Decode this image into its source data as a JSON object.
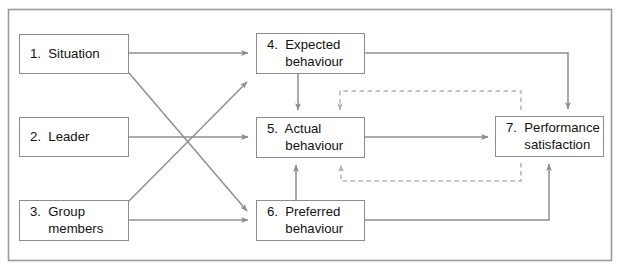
{
  "figure": {
    "frame": {
      "stroke": "#9a9a9a",
      "x": 8,
      "y": 9,
      "width": 604,
      "height": 252
    },
    "canvas": {
      "width": 621,
      "height": 275,
      "background": "#ffffff"
    },
    "colors": {
      "box_border": "#8c8c8c",
      "text": "#111111",
      "solid_arrow": "#8f8f8f",
      "dashed_arrow": "#b4b4b4",
      "background": "#ffffff"
    }
  },
  "nodes": [
    {
      "id": "n1",
      "number": "1.",
      "label": "Situation",
      "text": "1.  Situation",
      "x": 19,
      "y": 34,
      "width": 110,
      "height": 40
    },
    {
      "id": "n2",
      "number": "2.",
      "label": "Leader",
      "text": "2.  Leader",
      "x": 19,
      "y": 117,
      "width": 110,
      "height": 40
    },
    {
      "id": "n3",
      "number": "3.",
      "label": "Group members",
      "text": "3.  Group\n     members",
      "x": 19,
      "y": 200,
      "width": 110,
      "height": 41
    },
    {
      "id": "n4",
      "number": "4.",
      "label": "Expected behaviour",
      "text": "4.  Expected\n     behaviour",
      "x": 256,
      "y": 33,
      "width": 109,
      "height": 41
    },
    {
      "id": "n5",
      "number": "5.",
      "label": "Actual behaviour",
      "text": "5.  Actual\n     behaviour",
      "x": 256,
      "y": 117,
      "width": 109,
      "height": 41
    },
    {
      "id": "n6",
      "number": "6.",
      "label": "Preferred behaviour",
      "text": "6.  Preferred\n     behaviour",
      "x": 256,
      "y": 200,
      "width": 109,
      "height": 41
    },
    {
      "id": "n7",
      "number": "7.",
      "label": "Performance satisfaction",
      "text": "7.  Performance\n     satisfaction",
      "x": 495,
      "y": 116,
      "width": 109,
      "height": 41
    }
  ],
  "edges": [
    {
      "id": "e1",
      "from": "n1",
      "to": "n4",
      "style": "solid",
      "label": ""
    },
    {
      "id": "e2",
      "from": "n1",
      "to": "n6",
      "style": "solid",
      "label": ""
    },
    {
      "id": "e3",
      "from": "n2",
      "to": "n5",
      "style": "solid",
      "label": ""
    },
    {
      "id": "e4",
      "from": "n3",
      "to": "n4",
      "style": "solid",
      "label": ""
    },
    {
      "id": "e5",
      "from": "n3",
      "to": "n6",
      "style": "solid",
      "label": ""
    },
    {
      "id": "e6",
      "from": "n4",
      "to": "n5",
      "style": "solid",
      "label": ""
    },
    {
      "id": "e7",
      "from": "n4",
      "to": "n7",
      "style": "solid",
      "label": ""
    },
    {
      "id": "e8",
      "from": "n5",
      "to": "n7",
      "style": "solid",
      "label": ""
    },
    {
      "id": "e9",
      "from": "n6",
      "to": "n5",
      "style": "solid",
      "label": ""
    },
    {
      "id": "e10",
      "from": "n6",
      "to": "n7",
      "style": "solid",
      "label": ""
    },
    {
      "id": "e11",
      "from": "n7",
      "to": "n5",
      "style": "dashed",
      "label": ""
    },
    {
      "id": "e12",
      "from": "n7",
      "to": "n5",
      "style": "dashed",
      "label": ""
    }
  ]
}
